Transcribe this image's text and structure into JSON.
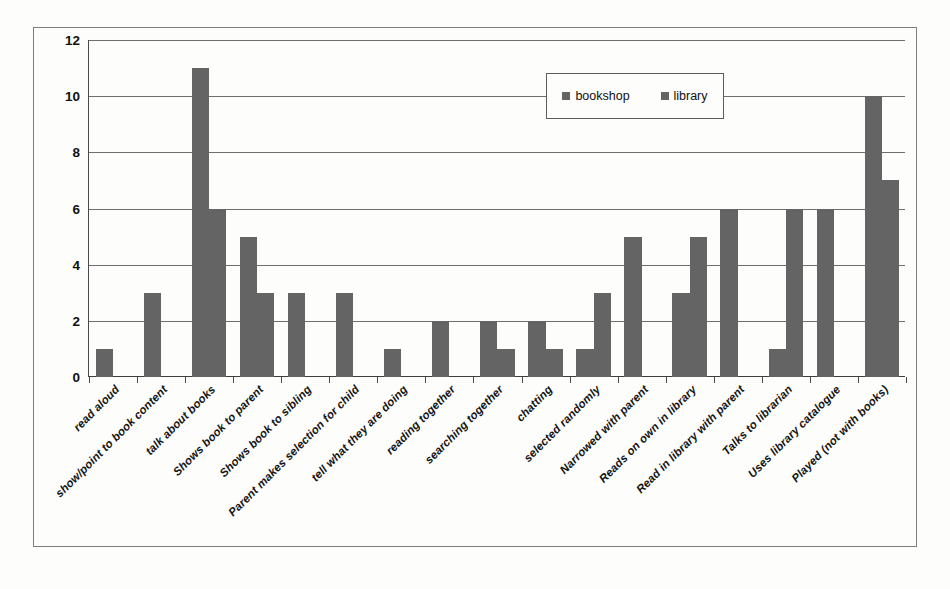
{
  "chart_data": {
    "type": "bar",
    "title": "",
    "xlabel": "",
    "ylabel": "",
    "ylim": [
      0,
      12
    ],
    "yticks": [
      0,
      2,
      4,
      6,
      8,
      10,
      12
    ],
    "grid": true,
    "legend_position": "inside-top-right",
    "categories": [
      "read aloud",
      "show/point to book content",
      "talk about books",
      "Shows book to parent",
      "Shows book to sibling",
      "Parent makes selection for child",
      "tell what they are doing",
      "reading together",
      "searching together",
      "chatting",
      "selected randomly",
      "Narrowed with parent",
      "Reads on own in library",
      "Read in library with parent",
      "Talks to librarian",
      "Uses library catalogue",
      "Played (not with books)"
    ],
    "series": [
      {
        "name": "bookshop",
        "color": "#646464",
        "values": [
          1,
          3,
          11,
          5,
          3,
          3,
          1,
          2,
          2,
          2,
          1,
          5,
          3,
          6,
          1,
          6,
          10
        ]
      },
      {
        "name": "library",
        "color": "#646464",
        "values": [
          0,
          0,
          6,
          3,
          0,
          0,
          0,
          0,
          1,
          1,
          3,
          0,
          5,
          0,
          6,
          0,
          7
        ]
      }
    ]
  },
  "legend": {
    "entries": [
      {
        "label": "bookshop",
        "swatch": "legend-swatch-icon"
      },
      {
        "label": "library",
        "swatch": "legend-swatch-icon"
      }
    ]
  },
  "colors": {
    "bar": "#646464",
    "grid": "#6f6f6f",
    "axis": "#3d3d3d",
    "frame": "#7d7d7d",
    "background": "#fdfdfb",
    "text": "#111111"
  }
}
